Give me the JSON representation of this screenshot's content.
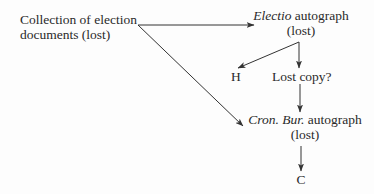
{
  "diagram": {
    "type": "stemma",
    "nodes": {
      "collection": {
        "line1": "Collection of election",
        "line2": "documents (lost)"
      },
      "electio": {
        "title_italic": "Electio",
        "title_rest": " autograph",
        "line2": "(lost)"
      },
      "h": {
        "label": "H"
      },
      "lost_copy": {
        "label": "Lost copy?"
      },
      "cron_bur": {
        "title_italic": "Cron. Bur.",
        "title_rest": " autograph",
        "line2": "(lost)"
      },
      "c": {
        "label": "C"
      }
    },
    "edges": [
      {
        "from": "collection",
        "to": "electio"
      },
      {
        "from": "collection",
        "to": "cron_bur"
      },
      {
        "from": "electio",
        "to": "h"
      },
      {
        "from": "electio",
        "to": "lost_copy"
      },
      {
        "from": "lost_copy",
        "to": "cron_bur"
      },
      {
        "from": "cron_bur",
        "to": "c"
      }
    ],
    "colors": {
      "line": "#333333",
      "text": "#2a2a2a",
      "background": "#fdfdfd"
    }
  }
}
